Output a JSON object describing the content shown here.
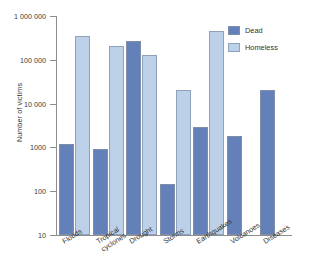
{
  "chart_data": {
    "type": "bar",
    "title": "",
    "xlabel": "",
    "ylabel": "Number of victims",
    "yscale": "log",
    "ylim": [
      10,
      1000000
    ],
    "ytick_labels": [
      "1 000 000",
      "100 000",
      "10 000",
      "1000",
      "100",
      "10"
    ],
    "ytick_values": [
      1000000,
      100000,
      10000,
      1000,
      100,
      10
    ],
    "grid": false,
    "legend_position": "top-right",
    "categories": [
      "Floods",
      "Tropical cyclones",
      "Drought",
      "Storms",
      "Earthquakes",
      "Volcanoes",
      "Diseases"
    ],
    "series": [
      {
        "name": "Dead",
        "color": "#6480b8",
        "values": [
          1200,
          900,
          270000,
          150,
          3000,
          1800,
          20000
        ]
      },
      {
        "name": "Homeless",
        "color": "#bcd0e8",
        "values": [
          350000,
          210000,
          130000,
          20000,
          450000,
          null,
          null
        ]
      }
    ]
  },
  "legend": {
    "items": [
      {
        "label": "Dead"
      },
      {
        "label": "Homeless"
      }
    ]
  },
  "axis": {
    "y_title": "Number of victims"
  }
}
